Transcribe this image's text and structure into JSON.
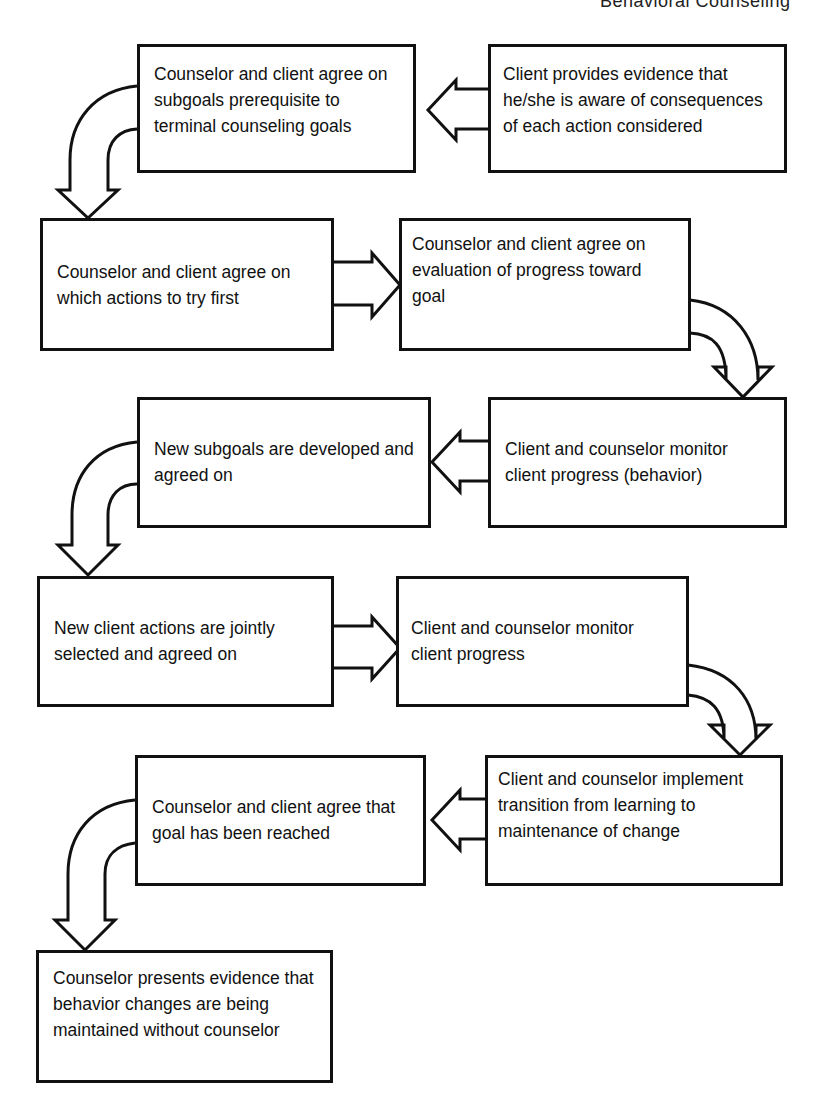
{
  "running_head": "Behavioral Counseling",
  "steps": [
    {
      "id": 1,
      "text": "Counselor and client agree on subgoals prerequisite to terminal counseling goals"
    },
    {
      "id": 2,
      "text": "Client provides evidence that he/she is aware of consequences of each action considered"
    },
    {
      "id": 3,
      "text": "Counselor and client agree on which actions to try first"
    },
    {
      "id": 4,
      "text": "Counselor and client agree on evaluation of progress toward goal"
    },
    {
      "id": 5,
      "text": "New subgoals are developed and agreed on"
    },
    {
      "id": 6,
      "text": "Client and counselor monitor client progress (behavior)"
    },
    {
      "id": 7,
      "text": "New client actions are jointly selected and agreed on"
    },
    {
      "id": 8,
      "text": "Client and counselor monitor client progress"
    },
    {
      "id": 9,
      "text": "Counselor and client agree that goal has been reached"
    },
    {
      "id": 10,
      "text": "Client and counselor implement transition from learning to maintenance of change"
    },
    {
      "id": 11,
      "text": "Counselor presents evidence that behavior changes are being maintained without counselor"
    }
  ],
  "flow": [
    {
      "from": 2,
      "to": 1,
      "direction": "left"
    },
    {
      "from": 1,
      "to": 3,
      "direction": "curved-down-left"
    },
    {
      "from": 3,
      "to": 4,
      "direction": "right"
    },
    {
      "from": 4,
      "to": 6,
      "direction": "curved-down-right"
    },
    {
      "from": 6,
      "to": 5,
      "direction": "left"
    },
    {
      "from": 5,
      "to": 7,
      "direction": "curved-down-left"
    },
    {
      "from": 7,
      "to": 8,
      "direction": "right"
    },
    {
      "from": 8,
      "to": 10,
      "direction": "curved-down-right"
    },
    {
      "from": 10,
      "to": 9,
      "direction": "left"
    },
    {
      "from": 9,
      "to": 11,
      "direction": "curved-down-left"
    }
  ]
}
